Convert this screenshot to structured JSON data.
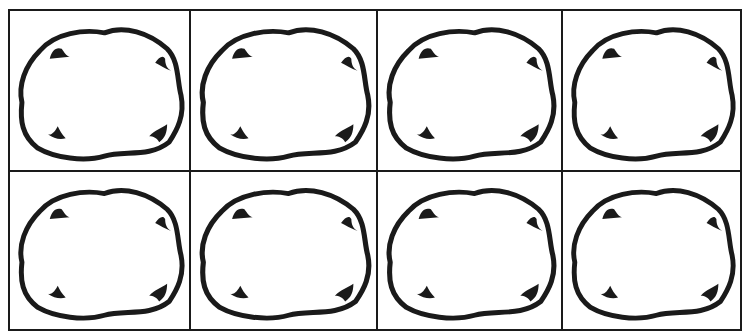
{
  "worksheet": {
    "rows": 2,
    "columns": 4,
    "cell_shape": "wobbly-oval-outline",
    "corner_marks_per_cell": 4,
    "colors": {
      "line": "#1a1a1a",
      "background": "#ffffff"
    },
    "cells": [
      {
        "id": "r1c1"
      },
      {
        "id": "r1c2"
      },
      {
        "id": "r1c3"
      },
      {
        "id": "r1c4"
      },
      {
        "id": "r2c1"
      },
      {
        "id": "r2c2"
      },
      {
        "id": "r2c3"
      },
      {
        "id": "r2c4"
      }
    ]
  }
}
